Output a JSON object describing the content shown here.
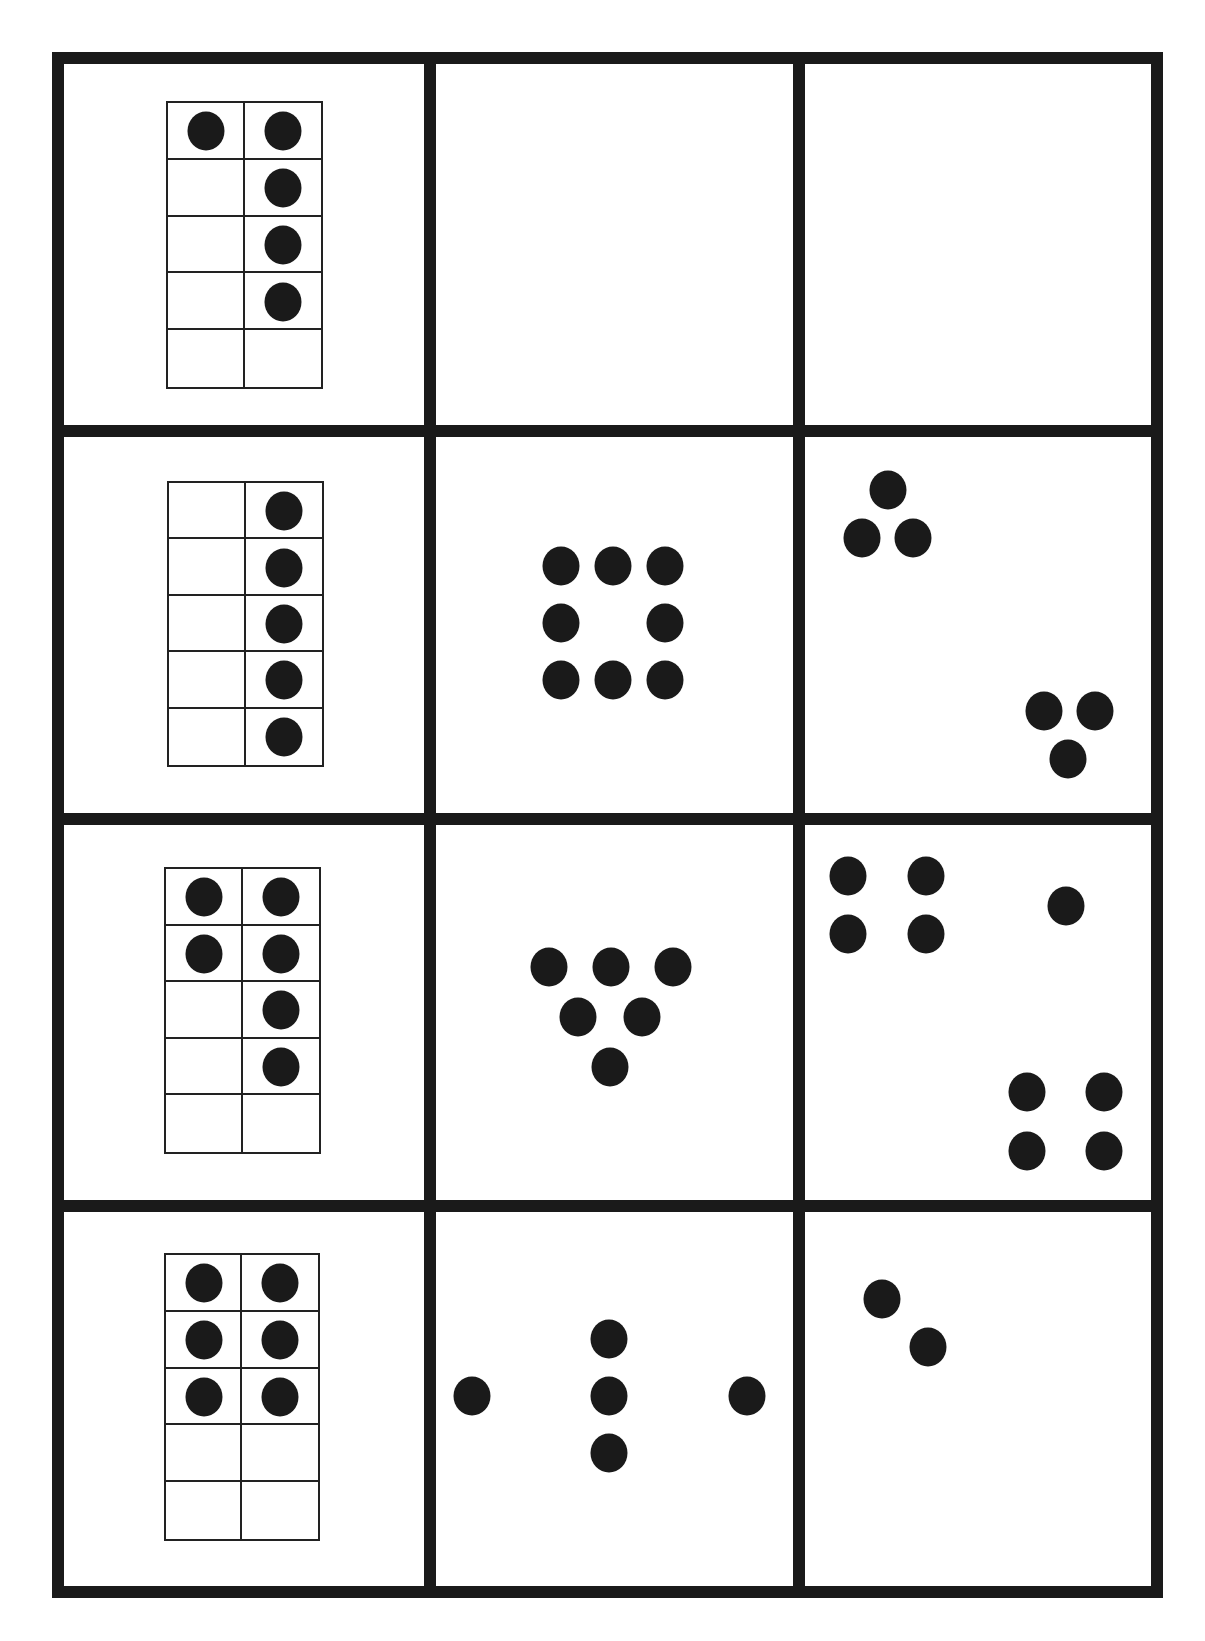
{
  "worksheet": {
    "title": "",
    "line_color": "#1a1a1a",
    "dot_color": "#1a1a1a",
    "background": "#ffffff",
    "grid": {
      "rows": 4,
      "cols": 3,
      "left": 52,
      "right": 1163,
      "top": 52,
      "bottom": 1598,
      "border": 12,
      "col_dividers": [
        424,
        793
      ],
      "row_dividers": [
        425,
        813,
        1200
      ]
    },
    "rows": [
      {
        "tenframe": {
          "x": 166,
          "y": 101,
          "w": 157,
          "h": 288,
          "filled": [
            [
              1,
              1
            ],
            [
              0,
              1
            ],
            [
              0,
              1
            ],
            [
              0,
              1
            ],
            [
              0,
              0
            ]
          ],
          "count": 5
        },
        "dot_cards": [
          {
            "count": 0,
            "dots": []
          },
          {
            "count": 0,
            "dots": []
          }
        ]
      },
      {
        "tenframe": {
          "x": 167,
          "y": 481,
          "w": 157,
          "h": 286,
          "filled": [
            [
              0,
              1
            ],
            [
              0,
              1
            ],
            [
              0,
              1
            ],
            [
              0,
              1
            ],
            [
              0,
              1
            ]
          ],
          "count": 5
        },
        "dot_cards": [
          {
            "count": 8,
            "dots": [
              [
                561,
                566
              ],
              [
                613,
                566
              ],
              [
                665,
                566
              ],
              [
                561,
                623
              ],
              [
                665,
                623
              ],
              [
                561,
                680
              ],
              [
                613,
                680
              ],
              [
                665,
                680
              ]
            ]
          },
          {
            "count": 6,
            "dots": [
              [
                888,
                490
              ],
              [
                862,
                538
              ],
              [
                913,
                538
              ],
              [
                1044,
                711
              ],
              [
                1095,
                711
              ],
              [
                1068,
                759
              ]
            ]
          }
        ]
      },
      {
        "tenframe": {
          "x": 164,
          "y": 867,
          "w": 157,
          "h": 287,
          "filled": [
            [
              1,
              1
            ],
            [
              1,
              1
            ],
            [
              0,
              1
            ],
            [
              0,
              1
            ],
            [
              0,
              0
            ]
          ],
          "count": 6
        },
        "dot_cards": [
          {
            "count": 6,
            "dots": [
              [
                549,
                967
              ],
              [
                611,
                967
              ],
              [
                673,
                967
              ],
              [
                578,
                1017
              ],
              [
                642,
                1017
              ],
              [
                610,
                1067
              ]
            ]
          },
          {
            "count": 9,
            "dots": [
              [
                848,
                876
              ],
              [
                926,
                876
              ],
              [
                848,
                934
              ],
              [
                926,
                934
              ],
              [
                1066,
                906
              ],
              [
                1027,
                1092
              ],
              [
                1104,
                1092
              ],
              [
                1027,
                1151
              ],
              [
                1104,
                1151
              ]
            ]
          }
        ]
      },
      {
        "tenframe": {
          "x": 164,
          "y": 1253,
          "w": 156,
          "h": 288,
          "filled": [
            [
              1,
              1
            ],
            [
              1,
              1
            ],
            [
              1,
              1
            ],
            [
              0,
              0
            ],
            [
              0,
              0
            ]
          ],
          "count": 6
        },
        "dot_cards": [
          {
            "count": 5,
            "dots": [
              [
                472,
                1396
              ],
              [
                609,
                1339
              ],
              [
                609,
                1396
              ],
              [
                609,
                1453
              ],
              [
                747,
                1396
              ]
            ]
          },
          {
            "count": 2,
            "dots": [
              [
                882,
                1299
              ],
              [
                928,
                1347
              ]
            ]
          }
        ]
      }
    ]
  }
}
